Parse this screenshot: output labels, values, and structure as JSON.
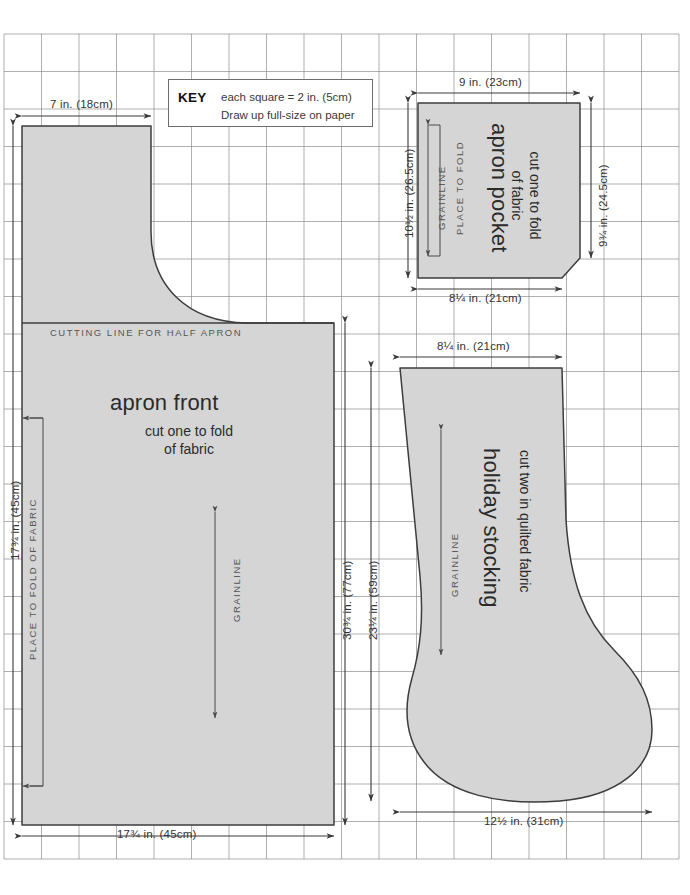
{
  "page": {
    "grid": {
      "origin_x": 4,
      "origin_y": 34,
      "cell": 37.5,
      "cols": 18,
      "rows": 22,
      "line_color": "#8a8a8a",
      "background": "#ffffff",
      "note": "each grid square equals 2 in. (5cm)"
    },
    "piece_fill": "#d5d5d5",
    "piece_stroke": "#3d3d3d",
    "dimension_color": "#333333"
  },
  "key": {
    "heading": "KEY",
    "line_1": "each square = 2 in. (5cm)",
    "line_2": "Draw up full-size on paper"
  },
  "pieces": [
    {
      "id": "apron-front",
      "title": "apron front",
      "subtitle": "cut one to fold\nof fabric",
      "cutting_line_label": "CUTTING LINE FOR HALF APRON",
      "grainline_label": "GRAINLINE",
      "fold_label": "PLACE TO FOLD OF FABRIC",
      "dimensions": {
        "top_width": "7 in. (18cm)",
        "bottom_width": "17¾ in. (45cm)",
        "left_height": "17¾ in. (45cm)",
        "right_height_inner": "30¾ in. (77cm)",
        "right_height_outer": "23¼ in. (59cm)"
      }
    },
    {
      "id": "apron-pocket",
      "title": "apron pocket",
      "subtitle": "cut one to fold\nof fabric",
      "grainline_label": "GRAINLINE",
      "fold_label": "PLACE TO FOLD",
      "dimensions": {
        "top_width": "9 in. (23cm)",
        "bottom_width": "8¼ in. (21cm)",
        "left_height": "10½ in. (26.5cm)",
        "right_height": "9¾ in. (24.5cm)"
      }
    },
    {
      "id": "holiday-stocking",
      "title": "holiday stocking",
      "subtitle": "cut two in quilted fabric",
      "grainline_label": "GRAINLINE",
      "dimensions": {
        "top_width": "8¼ in. (21cm)",
        "bottom_width": "12½ in. (31cm)",
        "left_height": "23¼ in. (59cm)"
      }
    }
  ]
}
